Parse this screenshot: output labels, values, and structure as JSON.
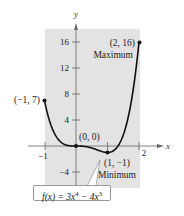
{
  "chart_data": {
    "type": "line",
    "title": "",
    "function": "f(x) = 3x^4 - 4x^3",
    "xlabel": "x",
    "ylabel": "y",
    "xlim": [
      -1,
      2
    ],
    "ylim": [
      -6,
      18
    ],
    "x_ticks": [
      -1,
      1,
      2
    ],
    "x_tick_labels": [
      "−1",
      "",
      "2"
    ],
    "y_ticks": [
      -4,
      4,
      8,
      12,
      16
    ],
    "y_tick_labels": [
      "−4",
      "4",
      "8",
      "12",
      "16"
    ],
    "grid": false,
    "shaded_region": {
      "x": [
        -1,
        2
      ],
      "color": "#e3e3e3"
    },
    "points": [
      {
        "x": -1,
        "y": 7,
        "label": "(−1, 7)"
      },
      {
        "x": 0,
        "y": 0,
        "label": "(0, 0)"
      },
      {
        "x": 1,
        "y": -1,
        "label": "(1, −1)",
        "annotation": "Minimum"
      },
      {
        "x": 2,
        "y": 16,
        "label": "(2, 16)",
        "annotation": "Maximum"
      }
    ],
    "series": [
      {
        "name": "f(x) = 3x^4 - 4x^3",
        "x": [
          -1,
          -0.5,
          0,
          0.5,
          0.75,
          1,
          1.25,
          1.5,
          1.75,
          2
        ],
        "y": [
          7,
          0.6875,
          0,
          -0.3125,
          -0.5383,
          -1,
          0,
          3.375,
          9.5898,
          16
        ]
      }
    ]
  },
  "labels": {
    "formula_prefix": "f(x) = 3x",
    "formula_exp1": "4",
    "formula_mid": " − 4x",
    "formula_exp2": "3",
    "maximum": "Maximum",
    "minimum": "Minimum"
  }
}
